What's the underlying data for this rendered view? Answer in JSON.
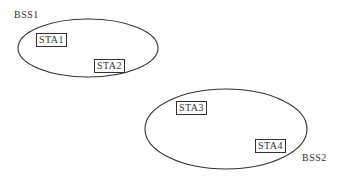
{
  "diagram": {
    "bss": [
      {
        "label": "BSS1",
        "stations": [
          "STA1",
          "STA2"
        ]
      },
      {
        "label": "BSS2",
        "stations": [
          "STA3",
          "STA4"
        ]
      }
    ],
    "colors": {
      "stroke": "#333333",
      "background": "#ffffff"
    }
  }
}
